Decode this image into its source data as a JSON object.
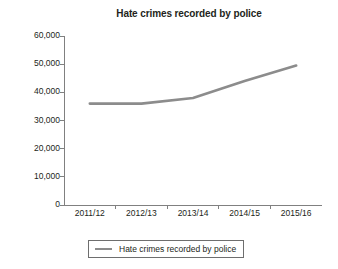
{
  "chart_data": {
    "type": "line",
    "title": "Hate crimes recorded by police",
    "xlabel": "",
    "ylabel": "",
    "categories": [
      "2011/12",
      "2012/13",
      "2013/14",
      "2014/15",
      "2015/16"
    ],
    "series": [
      {
        "name": "Hate crimes recorded by police",
        "values": [
          36000,
          36000,
          38000,
          44000,
          49500
        ],
        "color": "#8c8c8c"
      }
    ],
    "ylim": [
      0,
      60000
    ],
    "yticks": [
      0,
      10000,
      20000,
      30000,
      40000,
      50000,
      60000
    ],
    "ytick_labels": [
      "0",
      "10,000",
      "20,000",
      "30,000",
      "40,000",
      "50,000",
      "60,000"
    ],
    "grid": false,
    "legend_position": "bottom"
  },
  "legend": {
    "entries": [
      {
        "label": "Hate crimes recorded by police",
        "color": "#8c8c8c"
      }
    ]
  },
  "colors": {
    "line": "#8c8c8c",
    "axis": "#808080",
    "text": "#231f20",
    "background": "#ffffff",
    "legend_border": "#6e6e6e"
  }
}
